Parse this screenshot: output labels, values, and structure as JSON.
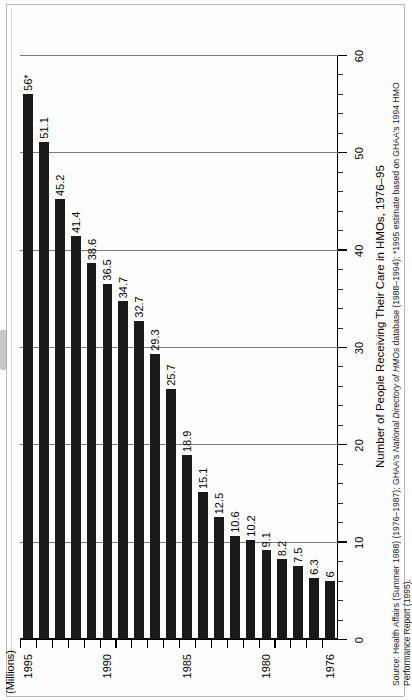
{
  "figure": {
    "title": "Number of People Receiving Their Care in HMOs, 1976–95",
    "axis_unit_label": "(Millions)",
    "source_line_1_a": "Source: Health Affairs (Summer 1988) (1976–1987); GHAA's ",
    "source_line_1_b": "National Directory of HMOs",
    "source_line_1_c": " database (1988–1994); *1995 estimate based on GHAA's 1994 HMO",
    "source_line_2": "Performance Report (1995).",
    "footnote_marker": "*"
  },
  "chart_data": {
    "type": "bar",
    "orientation": "vertical-rotated",
    "title": "Number of People Receiving Their Care in HMOs, 1976–95",
    "xlabel": "",
    "ylabel": "(Millions)",
    "ylim": [
      0,
      60
    ],
    "grid": true,
    "legend": "none",
    "y_major_ticks": [
      0,
      10,
      20,
      30,
      40,
      50,
      60
    ],
    "y_minor_tick_step": 2,
    "x_tick_labels_shown": [
      "1976",
      "1980",
      "1985",
      "1990",
      "1995"
    ],
    "categories": [
      "1976",
      "1977",
      "1978",
      "1979",
      "1980",
      "1981",
      "1982",
      "1983",
      "1984",
      "1985",
      "1986",
      "1987",
      "1988",
      "1989",
      "1990",
      "1991",
      "1992",
      "1993",
      "1994",
      "1995"
    ],
    "values": [
      6,
      6.3,
      7.5,
      8.2,
      9.1,
      10.2,
      10.6,
      12.5,
      15.1,
      18.9,
      25.7,
      29.3,
      32.7,
      34.7,
      36.5,
      38.6,
      41.4,
      45.2,
      51.1,
      56
    ],
    "data_labels": [
      "6",
      "6.3",
      "7.5",
      "8.2",
      "9.1",
      "10.2",
      "10.6",
      "12.5",
      "15.1",
      "18.9",
      "25.7",
      "29.3",
      "32.7",
      "34.7",
      "36.5",
      "38.6",
      "41.4",
      "45.2",
      "51.1",
      "56*"
    ],
    "annotations": [
      "* 1995 estimate"
    ]
  }
}
